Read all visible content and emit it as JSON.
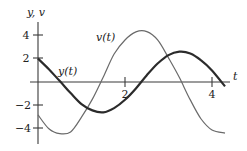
{
  "chart_data": {
    "type": "line",
    "title": "",
    "xlabel": "t",
    "ylabel": "y, v",
    "xlim": [
      0,
      4.3
    ],
    "ylim": [
      -5,
      5
    ],
    "x_ticks": [
      2,
      4
    ],
    "x_tick_labels": [
      "2",
      "4"
    ],
    "y_ticks": [
      4,
      2,
      -2,
      -4
    ],
    "y_tick_labels": [
      "4",
      "2",
      "−2",
      "−4"
    ],
    "grid": false,
    "legend": "none (curves labeled inline)",
    "annotations": [
      {
        "text": "v(t)",
        "near": "rising v curve, upper middle"
      },
      {
        "text": "y(t)",
        "near": "y curve just above t-axis, left"
      }
    ],
    "x": [
      0,
      0.25,
      0.5,
      0.75,
      1.0,
      1.25,
      1.5,
      1.75,
      2.0,
      2.25,
      2.5,
      2.75,
      3.0,
      3.25,
      3.5,
      3.75,
      4.0,
      4.3
    ],
    "series": [
      {
        "name": "y(t)",
        "style": "thick dark",
        "values": [
          2.0,
          1.09,
          0.08,
          -0.95,
          -1.9,
          -2.43,
          -2.59,
          -2.23,
          -1.52,
          -0.55,
          0.58,
          1.58,
          2.3,
          2.59,
          2.44,
          1.85,
          0.98,
          -0.38
        ]
      },
      {
        "name": "v(t)",
        "style": "thin gray",
        "values": [
          -2.81,
          -4.0,
          -4.42,
          -4.27,
          -3.01,
          -1.46,
          0.43,
          2.39,
          3.59,
          4.28,
          4.31,
          3.6,
          2.06,
          0.38,
          -1.53,
          -3.16,
          -4.1,
          -4.37
        ]
      }
    ]
  },
  "labels": {
    "y_axis": "y, v",
    "x_axis": "t",
    "v_curve": "v(t)",
    "y_curve": "y(t)",
    "tick_t2": "2",
    "tick_t4": "4",
    "tick_y4": "4",
    "tick_y2": "2",
    "tick_yn2": "−2",
    "tick_yn4": "−4"
  }
}
